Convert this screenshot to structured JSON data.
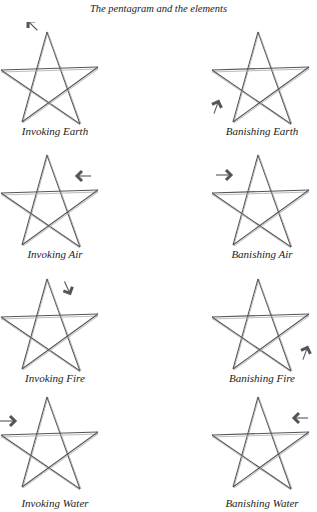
{
  "title": "The pentagram and the elements",
  "colors": {
    "line": "#555555",
    "arrow": "#555555",
    "text": "#222222"
  },
  "diagrams": [
    {
      "label": "Invoking Earth",
      "arrow": "arrow-down-left-icon"
    },
    {
      "label": "Banishing Earth",
      "arrow": "arrow-up-icon"
    },
    {
      "label": "Invoking Air",
      "arrow": "arrow-left-icon"
    },
    {
      "label": "Banishing Air",
      "arrow": "arrow-right-icon"
    },
    {
      "label": "Invoking Fire",
      "arrow": "arrow-down-right-icon"
    },
    {
      "label": "Banishing Fire",
      "arrow": "arrow-up-icon"
    },
    {
      "label": "Invoking Water",
      "arrow": "arrow-right-icon"
    },
    {
      "label": "Banishing Water",
      "arrow": "arrow-left-icon"
    }
  ]
}
